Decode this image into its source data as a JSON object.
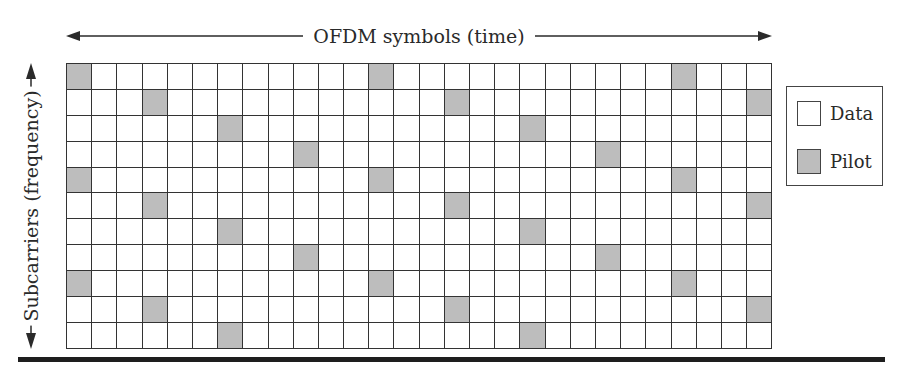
{
  "title_axis": {
    "label": "OFDM symbols (time)",
    "direction": "horizontal, bidirectional arrow"
  },
  "vertical_axis": {
    "label": "Subcarriers (frequency)",
    "direction": "vertical, bidirectional arrow"
  },
  "grid": {
    "columns": 28,
    "rows": 11,
    "pilot_color": "#bdbdbd",
    "data_color": "#ffffff",
    "line_color": "#333333",
    "pilot_pattern": "diagonal/scattered: row r pilots at columns where (col - 3*(r mod 4)) mod 12 == 0",
    "pilots": [
      {
        "row": 0,
        "cols": [
          0,
          12,
          24
        ]
      },
      {
        "row": 1,
        "cols": [
          3,
          15,
          27
        ]
      },
      {
        "row": 2,
        "cols": [
          6,
          18
        ]
      },
      {
        "row": 3,
        "cols": [
          9,
          21
        ]
      },
      {
        "row": 4,
        "cols": [
          0,
          12,
          24
        ]
      },
      {
        "row": 5,
        "cols": [
          3,
          15,
          27
        ]
      },
      {
        "row": 6,
        "cols": [
          6,
          18
        ]
      },
      {
        "row": 7,
        "cols": [
          9,
          21
        ]
      },
      {
        "row": 8,
        "cols": [
          0,
          12,
          24
        ]
      },
      {
        "row": 9,
        "cols": [
          3,
          15,
          27
        ]
      },
      {
        "row": 10,
        "cols": [
          6,
          18
        ]
      }
    ]
  },
  "legend": {
    "items": [
      {
        "label": "Data",
        "color": "#ffffff"
      },
      {
        "label": "Pilot",
        "color": "#bdbdbd"
      }
    ]
  }
}
